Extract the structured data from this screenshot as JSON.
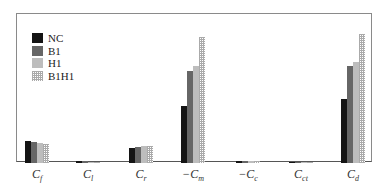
{
  "chart_data": {
    "type": "bar",
    "title": "",
    "xlabel": "",
    "ylabel": "",
    "grid": false,
    "legend_position": "upper-left",
    "categories": [
      "Cf",
      "Cl",
      "Cr",
      "−Cm",
      "−Cc",
      "Cct",
      "Cd"
    ],
    "category_labels": [
      {
        "prefix": "",
        "main": "C",
        "sub": "f"
      },
      {
        "prefix": "",
        "main": "C",
        "sub": "l"
      },
      {
        "prefix": "",
        "main": "C",
        "sub": "r"
      },
      {
        "prefix": "−",
        "main": "C",
        "sub": "m"
      },
      {
        "prefix": "−",
        "main": "C",
        "sub": "c"
      },
      {
        "prefix": "",
        "main": "C",
        "sub": "ct"
      },
      {
        "prefix": "",
        "main": "C",
        "sub": "d"
      }
    ],
    "ylim": [
      0,
      1
    ],
    "series": [
      {
        "name": "NC",
        "color": "#141414",
        "values": [
          0.17,
          0.015,
          0.12,
          0.44,
          0.015,
          0.004,
          0.5
        ]
      },
      {
        "name": "B1",
        "color": "#666666",
        "values": [
          0.16,
          0.012,
          0.125,
          0.71,
          0.015,
          0.004,
          0.75
        ]
      },
      {
        "name": "H1",
        "color": "#bdbdbd",
        "values": [
          0.155,
          0.008,
          0.13,
          0.75,
          0.012,
          0.004,
          0.78
        ]
      },
      {
        "name": "B1H1",
        "color": "#dotted",
        "values": [
          0.15,
          0.008,
          0.135,
          0.98,
          0.012,
          0.004,
          1.0
        ]
      }
    ]
  },
  "legend": [
    "NC",
    "B1",
    "H1",
    "B1H1"
  ]
}
